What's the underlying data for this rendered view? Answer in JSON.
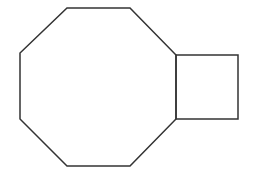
{
  "diagram": {
    "type": "geometric-figure",
    "width": 256,
    "height": 188,
    "background": "#ffffff",
    "stroke_color": "#333333",
    "stroke_width": 1.5,
    "shapes": [
      {
        "name": "octagon",
        "points": [
          [
            67,
            8
          ],
          [
            130,
            8
          ],
          [
            176,
            55
          ],
          [
            176,
            119
          ],
          [
            130,
            166
          ],
          [
            67,
            166
          ],
          [
            20,
            119
          ],
          [
            20,
            53
          ]
        ]
      },
      {
        "name": "square",
        "points": [
          [
            176,
            55
          ],
          [
            238,
            55
          ],
          [
            238,
            119
          ],
          [
            176,
            119
          ]
        ]
      }
    ]
  }
}
